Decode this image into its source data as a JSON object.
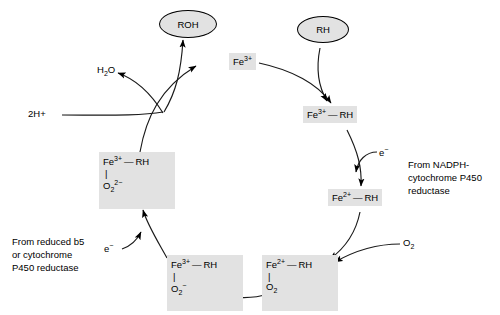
{
  "diagram": {
    "type": "cycle",
    "colors": {
      "species_fill": "#e2e2e2",
      "stroke": "#000000",
      "background": "#ffffff"
    },
    "substrate_node": {
      "label": "RH",
      "role": "substrate-input"
    },
    "product_node": {
      "label": "ROH",
      "role": "product-output"
    },
    "states": [
      {
        "id": "ferric-free",
        "line1_metal": "Fe",
        "line1_charge": "3+",
        "line1_ligand": "",
        "has_axial": false,
        "axial": ""
      },
      {
        "id": "ferric-substrate",
        "line1_metal": "Fe",
        "line1_charge": "3+",
        "line1_ligand": "RH",
        "has_axial": false,
        "axial": ""
      },
      {
        "id": "ferrous-substrate",
        "line1_metal": "Fe",
        "line1_charge": "2+",
        "line1_ligand": "RH",
        "has_axial": false,
        "axial": ""
      },
      {
        "id": "ferrous-dioxygen",
        "line1_metal": "Fe",
        "line1_charge": "2+",
        "line1_ligand": "RH",
        "has_axial": true,
        "axial_formula": "O",
        "axial_sub": "2",
        "axial_charge": ""
      },
      {
        "id": "ferric-superoxide",
        "line1_metal": "Fe",
        "line1_charge": "3+",
        "line1_ligand": "RH",
        "has_axial": true,
        "axial_formula": "O",
        "axial_sub": "2",
        "axial_charge": "−"
      },
      {
        "id": "ferric-peroxide",
        "line1_metal": "Fe",
        "line1_charge": "3+",
        "line1_ligand": "RH",
        "has_axial": true,
        "axial_formula": "O",
        "axial_sub": "2",
        "axial_charge": "2−"
      }
    ],
    "small_molecules": [
      {
        "id": "water-out",
        "label_html": "H",
        "sub": "2",
        "tail": "O",
        "plain": "H2O"
      },
      {
        "id": "protons-in",
        "plain": "2H+"
      },
      {
        "id": "dioxygen-in",
        "plain": "O2"
      }
    ],
    "electrons": [
      {
        "id": "electron-nadph",
        "label": "e−"
      },
      {
        "id": "electron-b5",
        "label": "e−"
      }
    ],
    "annotations": [
      {
        "id": "nadph-donor",
        "lines": [
          "From NADPH-",
          "cytochrome P450",
          "reductase"
        ]
      },
      {
        "id": "b5-donor",
        "lines": [
          "From reduced b5",
          "or cytochrome",
          "P450 reductase"
        ]
      }
    ],
    "labels": {
      "water": "H2O",
      "protons": "2H+",
      "oxygen": "O2",
      "electron": "e−",
      "fe3": "Fe3+",
      "fe2": "Fe2+",
      "rh": "RH",
      "roh": "ROH"
    }
  }
}
